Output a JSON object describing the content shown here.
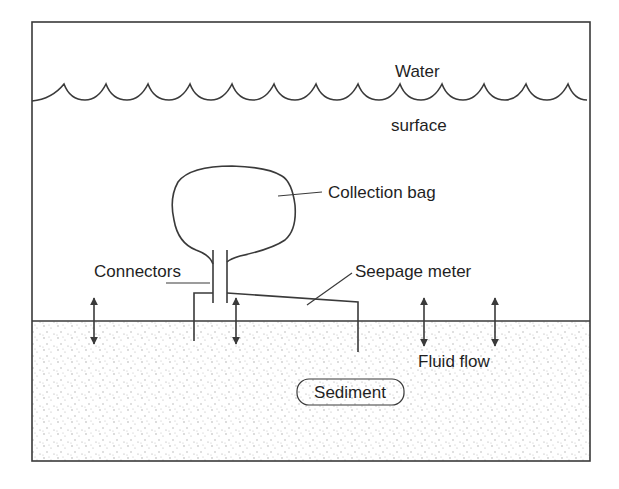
{
  "diagram": {
    "labels": {
      "water": "Water",
      "surface": "surface",
      "collection_bag": "Collection bag",
      "connectors": "Connectors",
      "seepage_meter": "Seepage meter",
      "fluid_flow": "Fluid flow",
      "sediment": "Sediment"
    },
    "regions": [
      {
        "name": "water-column",
        "color": "#ffffff"
      },
      {
        "name": "sediment-layer",
        "color": "#f4f4f4",
        "texture": "stippled"
      }
    ],
    "arrows": [
      {
        "name": "fluid-flow-arrow-1",
        "type": "bidirectional",
        "x": 94
      },
      {
        "name": "fluid-flow-arrow-2",
        "type": "bidirectional",
        "x": 236
      },
      {
        "name": "fluid-flow-arrow-3",
        "type": "bidirectional",
        "x": 424
      },
      {
        "name": "fluid-flow-arrow-4",
        "type": "bidirectional",
        "x": 495
      }
    ],
    "colors": {
      "line": "#3a3a3a",
      "text": "#1f1f1f",
      "sediment_dot": "#9a9a9a"
    }
  }
}
